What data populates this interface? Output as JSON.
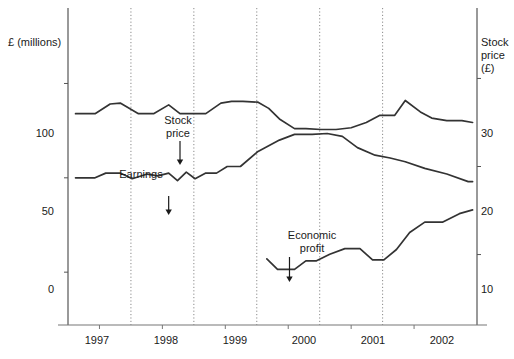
{
  "chart_data": {
    "type": "line",
    "title": "",
    "xlabel": "",
    "ylabel": "£ (millions)",
    "ylabel_right": "Stock price (£)",
    "xlim": [
      1996.5,
      2003.0
    ],
    "ylim": [
      -28,
      140
    ],
    "ylim_right": [
      2.0,
      38.0
    ],
    "grid": true,
    "gridlines_x": [
      1997.5,
      1998.5,
      1999.5,
      2000.5,
      2001.5
    ],
    "legend": "annotations",
    "xticks": [
      "1997",
      "1998",
      "1999",
      "2000",
      "2001",
      "2002"
    ],
    "xtick_values": [
      1997,
      1998,
      1999,
      2000,
      2001,
      2002
    ],
    "yticks_left": [
      "0",
      "50",
      "100"
    ],
    "ytick_values_left": [
      0,
      50,
      100
    ],
    "yticks_right": [
      "10",
      "20",
      "30"
    ],
    "ytick_values_right": [
      10,
      20,
      30
    ],
    "annotations": [
      {
        "text": "Stock\nprice",
        "series": "Stock price",
        "x": 1998.3
      },
      {
        "text": "Earnings",
        "series": "Earnings",
        "x": 1998.1
      },
      {
        "text": "Economic\nprofit",
        "series": "Economic profit",
        "x": 2000.0
      }
    ],
    "series": [
      {
        "name": "Stock price",
        "axis": "right",
        "color": "#333333",
        "x": [
          1996.62,
          1996.93,
          1997.17,
          1997.33,
          1997.62,
          1997.86,
          1998.1,
          1998.28,
          1998.45,
          1998.69,
          1998.93,
          1999.1,
          1999.28,
          1999.52,
          1999.69,
          1999.86,
          2000.1,
          2000.28,
          2000.52,
          2000.76,
          2001.0,
          2001.24,
          2001.45,
          2001.69,
          2001.86,
          2002.1,
          2002.28,
          2002.52,
          2002.76,
          2002.93
        ],
        "values": [
          26.0,
          26.0,
          27.1,
          27.2,
          26.0,
          26.0,
          27.0,
          26.0,
          26.0,
          26.0,
          27.2,
          27.4,
          27.4,
          27.3,
          26.6,
          25.4,
          24.3,
          24.3,
          24.2,
          24.2,
          24.4,
          25.0,
          25.8,
          25.8,
          27.5,
          26.2,
          25.5,
          25.2,
          25.2,
          25.0
        ]
      },
      {
        "name": "Earnings",
        "axis": "left",
        "color": "#333333",
        "x": [
          1996.62,
          1996.93,
          1997.1,
          1997.33,
          1997.52,
          1997.76,
          1997.93,
          1998.1,
          1998.24,
          1998.38,
          1998.52,
          1998.69,
          1998.86,
          1999.03,
          1999.24,
          1999.52,
          1999.86,
          2000.1,
          2000.38,
          2000.62,
          2000.86,
          2001.1,
          2001.38,
          2001.62,
          2001.86,
          2002.17,
          2002.52,
          2002.86,
          2002.93
        ],
        "values": [
          50.0,
          50.0,
          52.5,
          52.5,
          49.5,
          52.0,
          51.0,
          52.5,
          48.5,
          53.0,
          49.5,
          52.5,
          52.5,
          56.0,
          56.0,
          64.0,
          70.0,
          73.0,
          73.0,
          73.5,
          72.0,
          66.0,
          62.0,
          60.5,
          58.5,
          55.0,
          52.0,
          48.0,
          48.0
        ]
      },
      {
        "name": "Economic profit",
        "axis": "left",
        "color": "#333333",
        "x": [
          1999.66,
          1999.83,
          2000.1,
          2000.28,
          2000.45,
          2000.66,
          2000.9,
          2001.14,
          2001.34,
          2001.52,
          2001.72,
          2001.93,
          2002.17,
          2002.45,
          2002.72,
          2002.93
        ],
        "values": [
          7.0,
          1.5,
          1.5,
          6.0,
          6.0,
          9.5,
          12.5,
          12.5,
          6.5,
          6.5,
          12.0,
          21.0,
          26.5,
          26.5,
          31.0,
          33.0
        ]
      }
    ]
  },
  "labels": {
    "ylabel_left": "£ (millions)",
    "ylabel_right": "Stock\nprice\n(£)"
  }
}
